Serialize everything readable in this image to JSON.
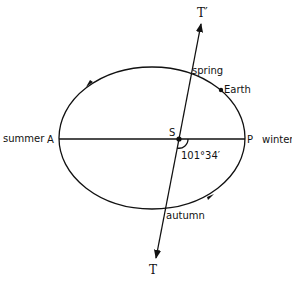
{
  "diagram": {
    "colors": {
      "ink": "#111111",
      "background": "#ffffff"
    },
    "labels": {
      "t_prime": "T′",
      "t": "T",
      "spring": "spring",
      "earth": "Earth",
      "summer": "summer",
      "a": "A",
      "s": "S",
      "p": "P",
      "winter": "winter",
      "angle": "101°34′",
      "autumn": "autumn"
    },
    "orbit": {
      "cx": 152,
      "cy": 138,
      "rx": 93,
      "ry": 71,
      "direction": "counterclockwise"
    },
    "apsides_line": {
      "from": "A",
      "to": "P"
    },
    "equinox_line": {
      "from": "T′",
      "to": "T",
      "through": "S"
    }
  }
}
